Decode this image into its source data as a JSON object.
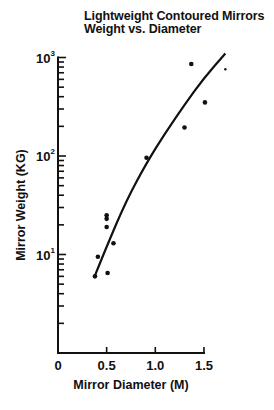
{
  "chart_data": {
    "type": "scatter",
    "title": "Lightweight Contoured Mirrors Weight vs. Diameter",
    "title_lines": [
      "Lightweight Contoured Mirrors",
      "Weight vs. Diameter"
    ],
    "xlabel": "Mirror Diameter (M)",
    "ylabel": "Mirror Weight (KG)",
    "xscale": "linear",
    "yscale": "log",
    "xlim": [
      0,
      1.7
    ],
    "ylim": [
      1,
      1000
    ],
    "x_ticks": [
      0,
      0.5,
      1.0,
      1.5
    ],
    "x_tick_labels": [
      "0",
      "0.5",
      "1.0",
      "1.5"
    ],
    "y_ticks": [
      10,
      100,
      1000
    ],
    "y_tick_labels": [
      {
        "base": "10",
        "exp": "1"
      },
      {
        "base": "10",
        "exp": "2"
      },
      {
        "base": "10",
        "exp": "3"
      }
    ],
    "grid": false,
    "legend": null,
    "series": [
      {
        "name": "Mirrors",
        "kind": "points",
        "points": [
          {
            "x": 0.38,
            "y": 6
          },
          {
            "x": 0.41,
            "y": 9.5
          },
          {
            "x": 0.5,
            "y": 25
          },
          {
            "x": 0.5,
            "y": 23
          },
          {
            "x": 0.5,
            "y": 19
          },
          {
            "x": 0.51,
            "y": 6.5
          },
          {
            "x": 0.57,
            "y": 13
          },
          {
            "x": 0.91,
            "y": 96
          },
          {
            "x": 1.3,
            "y": 195
          },
          {
            "x": 1.37,
            "y": 860
          },
          {
            "x": 1.51,
            "y": 350
          },
          {
            "x": 1.72,
            "y": 760
          }
        ]
      },
      {
        "name": "Fit curve",
        "kind": "line",
        "points": [
          {
            "x": 0.37,
            "y": 5.8
          },
          {
            "x": 0.5,
            "y": 12
          },
          {
            "x": 0.7,
            "y": 35
          },
          {
            "x": 0.91,
            "y": 85
          },
          {
            "x": 1.1,
            "y": 170
          },
          {
            "x": 1.3,
            "y": 330
          },
          {
            "x": 1.5,
            "y": 620
          },
          {
            "x": 1.72,
            "y": 1100
          }
        ]
      }
    ]
  }
}
